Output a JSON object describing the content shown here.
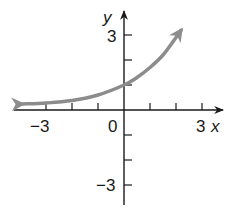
{
  "chart_data": {
    "type": "line",
    "title": "",
    "xlabel": "x",
    "ylabel": "y",
    "xlim": [
      -4,
      3.8
    ],
    "ylim": [
      -3.8,
      3.9
    ],
    "x_ticks": [
      -3,
      -2,
      -1,
      1,
      2,
      3
    ],
    "y_ticks": [
      -3,
      -2,
      -1,
      1,
      2,
      3
    ],
    "x_tick_labels": [
      {
        "value": -3,
        "label": "−3"
      },
      {
        "value": 0,
        "label": "0"
      },
      {
        "value": 3,
        "label": "3"
      }
    ],
    "y_tick_labels": [
      {
        "value": 3,
        "label": "3"
      },
      {
        "value": -3,
        "label": "−3"
      }
    ],
    "grid": false,
    "series": [
      {
        "name": "exponential curve",
        "color": "#8c8c8c",
        "arrows": "both",
        "x": [
          -3.9,
          -3,
          -2,
          -1,
          0,
          0.5,
          1,
          1.5,
          2,
          2.2
        ],
        "y": [
          0.24,
          0.28,
          0.38,
          0.6,
          1.0,
          1.3,
          1.7,
          2.2,
          2.9,
          3.2
        ]
      }
    ],
    "y_intercept": 1,
    "horizontal_asymptote": "y = 0"
  },
  "labels": {
    "x_axis": "x",
    "y_axis": "y",
    "x_neg3": "−3",
    "origin": "0",
    "x_pos3": "3",
    "y_pos3": "3",
    "y_neg3": "−3"
  },
  "colors": {
    "axis": "#1a1a1a",
    "curve": "#8c8c8c"
  }
}
